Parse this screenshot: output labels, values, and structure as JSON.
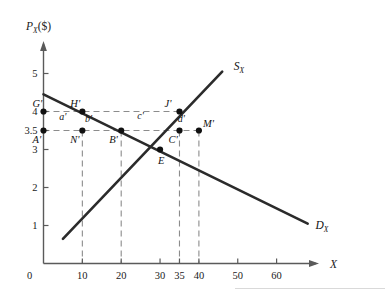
{
  "figure": {
    "y_axis_title": "P",
    "y_axis_title_sub": "X",
    "y_axis_title_unit": "($)",
    "x_axis_title": "X",
    "origin_label": "0"
  },
  "chart_data": {
    "type": "line",
    "title": "",
    "xlabel": "X",
    "ylabel": "P_X ($)",
    "xlim": [
      0,
      70
    ],
    "ylim": [
      0,
      5.6
    ],
    "grid": false,
    "legend": "inline-curve-labels",
    "x_ticks": [
      {
        "value": 10,
        "label": "10"
      },
      {
        "value": 20,
        "label": "20"
      },
      {
        "value": 30,
        "label": "30"
      },
      {
        "value": 35,
        "label": "35"
      },
      {
        "value": 40,
        "label": "40"
      },
      {
        "value": 50,
        "label": "50"
      },
      {
        "value": 60,
        "label": "60"
      }
    ],
    "y_ticks": [
      {
        "value": 1,
        "label": "1"
      },
      {
        "value": 2,
        "label": "2"
      },
      {
        "value": 3,
        "label": "3"
      },
      {
        "value": 3.5,
        "label": "3.5"
      },
      {
        "value": 4,
        "label": "4"
      },
      {
        "value": 5,
        "label": "5"
      }
    ],
    "series": [
      {
        "name": "D",
        "name_sub": "X",
        "label": "D_X",
        "type": "demand",
        "points": [
          {
            "x": 0,
            "y": 4.45
          },
          {
            "x": 68,
            "y": 1.05
          }
        ],
        "label_pos": {
          "x": 70,
          "y": 0.9
        }
      },
      {
        "name": "S",
        "name_sub": "X",
        "label": "S_X",
        "type": "supply",
        "points": [
          {
            "x": 5,
            "y": 0.65
          },
          {
            "x": 46,
            "y": 5.05
          }
        ],
        "label_pos": {
          "x": 49,
          "y": 5.1
        }
      }
    ],
    "points": [
      {
        "id": "G",
        "label": "G'",
        "x": 0,
        "y": 4,
        "lx": -11,
        "ly": -5
      },
      {
        "id": "A",
        "label": "A'",
        "x": 0,
        "y": 3.5,
        "lx": -11,
        "ly": 12
      },
      {
        "id": "H",
        "label": "H'",
        "x": 10,
        "y": 4,
        "lx": -12,
        "ly": -5
      },
      {
        "id": "N",
        "label": "N'",
        "x": 10,
        "y": 3.5,
        "lx": -12,
        "ly": 12
      },
      {
        "id": "B",
        "label": "B'",
        "x": 20,
        "y": 3.5,
        "lx": -12,
        "ly": 12
      },
      {
        "id": "E",
        "label": "E",
        "x": 30,
        "y": 3,
        "lx": -2,
        "ly": 14
      },
      {
        "id": "C",
        "label": "C'",
        "x": 35,
        "y": 3.5,
        "lx": -11,
        "ly": 12
      },
      {
        "id": "J",
        "label": "J'",
        "x": 35,
        "y": 4,
        "lx": -15,
        "ly": -5
      },
      {
        "id": "M",
        "label": "M'",
        "x": 40,
        "y": 3.5,
        "lx": 4,
        "ly": -4
      }
    ],
    "area_labels": [
      {
        "label": "a'",
        "x": 5,
        "y": 3.78
      },
      {
        "label": "b'",
        "x": 11.6,
        "y": 3.73
      },
      {
        "label": "c'",
        "x": 25,
        "y": 3.8
      },
      {
        "label": "d'",
        "x": 35.5,
        "y": 3.73
      }
    ],
    "dashed_guides": [
      {
        "from": {
          "x": 0,
          "y": 4
        },
        "to": {
          "x": 35,
          "y": 4
        }
      },
      {
        "from": {
          "x": 0,
          "y": 3.5
        },
        "to": {
          "x": 40,
          "y": 3.5
        }
      },
      {
        "from": {
          "x": 10,
          "y": 3.5
        },
        "to": {
          "x": 10,
          "y": 0
        }
      },
      {
        "from": {
          "x": 20,
          "y": 3.5
        },
        "to": {
          "x": 20,
          "y": 0
        }
      },
      {
        "from": {
          "x": 35,
          "y": 3.5
        },
        "to": {
          "x": 35,
          "y": 0
        }
      },
      {
        "from": {
          "x": 40,
          "y": 3.5
        },
        "to": {
          "x": 40,
          "y": 0
        }
      }
    ],
    "colors": {
      "curve": "#2b2b2b",
      "axis": "#5a5a5a",
      "dash": "#8c8c8c",
      "text": "#111111",
      "background": "#ffffff"
    }
  }
}
